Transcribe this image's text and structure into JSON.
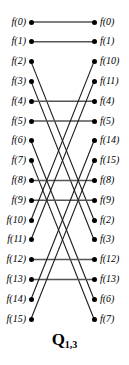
{
  "figure": {
    "caption_symbol": "Q",
    "caption_subscript": "1,3",
    "caption_full": "Q1,3",
    "node_color": "#000000",
    "edge_color_diagonal": "#1a1a1a",
    "edge_color_horizontal": "#555555",
    "background": "#ffffff",
    "text_color": "#000000"
  },
  "chart_data": {
    "type": "diagram",
    "title": "Q1,3",
    "node_count_per_column": 16,
    "left_column_labels": [
      "f(0)",
      "f(1)",
      "f(2)",
      "f(3)",
      "f(4)",
      "f(5)",
      "f(6)",
      "f(7)",
      "f(8)",
      "f(9)",
      "f(10)",
      "f(11)",
      "f(12)",
      "f(13)",
      "f(14)",
      "f(15)"
    ],
    "right_column_labels": [
      "f(0)",
      "f(1)",
      "f(10)",
      "f(11)",
      "f(4)",
      "f(5)",
      "f(14)",
      "f(15)",
      "f(8)",
      "f(9)",
      "f(2)",
      "f(3)",
      "f(12)",
      "f(13)",
      "f(6)",
      "f(7)"
    ],
    "left_column_indices": [
      0,
      1,
      2,
      3,
      4,
      5,
      6,
      7,
      8,
      9,
      10,
      11,
      12,
      13,
      14,
      15
    ],
    "right_column_indices": [
      0,
      1,
      10,
      11,
      4,
      5,
      14,
      15,
      8,
      9,
      2,
      3,
      12,
      13,
      6,
      7
    ],
    "edges": [
      {
        "left_row": 0,
        "right_row": 0,
        "value": 0
      },
      {
        "left_row": 1,
        "right_row": 1,
        "value": 1
      },
      {
        "left_row": 2,
        "right_row": 10,
        "value": 2
      },
      {
        "left_row": 3,
        "right_row": 11,
        "value": 3
      },
      {
        "left_row": 4,
        "right_row": 4,
        "value": 4
      },
      {
        "left_row": 5,
        "right_row": 5,
        "value": 5
      },
      {
        "left_row": 6,
        "right_row": 14,
        "value": 6
      },
      {
        "left_row": 7,
        "right_row": 15,
        "value": 7
      },
      {
        "left_row": 8,
        "right_row": 8,
        "value": 8
      },
      {
        "left_row": 9,
        "right_row": 9,
        "value": 9
      },
      {
        "left_row": 10,
        "right_row": 2,
        "value": 10
      },
      {
        "left_row": 11,
        "right_row": 3,
        "value": 11
      },
      {
        "left_row": 12,
        "right_row": 12,
        "value": 12
      },
      {
        "left_row": 13,
        "right_row": 13,
        "value": 13
      },
      {
        "left_row": 14,
        "right_row": 6,
        "value": 14
      },
      {
        "left_row": 15,
        "right_row": 7,
        "value": 15
      }
    ]
  },
  "geometry": {
    "left_node_x": 31,
    "right_node_x": 94,
    "first_node_y": 22,
    "row_spacing": 19.8,
    "left_label_right_edge": 26,
    "right_label_left_edge": 100
  }
}
